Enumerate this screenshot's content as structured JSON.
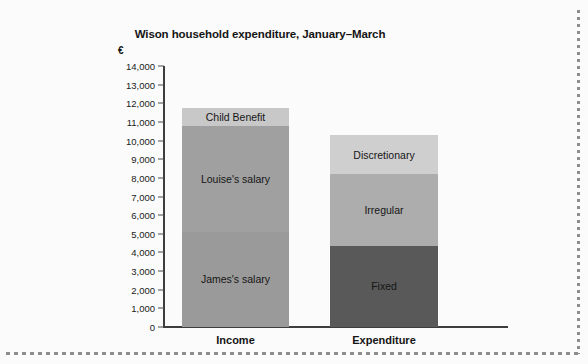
{
  "figure": {
    "background_color": "#fbfbfb",
    "border_style": "dashed-gray-edge"
  },
  "chart_data": {
    "type": "bar",
    "subtype": "stacked",
    "title": "Wison household expenditure, January–March",
    "xlabel": "",
    "ylabel": "",
    "y_unit_symbol": "€",
    "categories": [
      "Income",
      "Expenditure"
    ],
    "ylim": [
      0,
      14000
    ],
    "y_tick_step": 1000,
    "y_ticks": [
      0,
      1000,
      2000,
      3000,
      4000,
      5000,
      6000,
      7000,
      8000,
      9000,
      10000,
      11000,
      12000,
      13000,
      14000
    ],
    "y_tick_labels": [
      "0",
      "1,000",
      "2,000",
      "3,000",
      "4,000",
      "5,000",
      "6,000",
      "7,000",
      "8,000",
      "9,000",
      "10,000",
      "11,000",
      "12,000",
      "13,000",
      "14,000"
    ],
    "grid": false,
    "legend": "inline-segment-labels",
    "stacks": [
      {
        "category": "Income",
        "total": 11750,
        "segments": [
          {
            "name": "James's salary",
            "value": 5100,
            "start": 0,
            "end": 5100,
            "color": "#9a9a9a"
          },
          {
            "name": "Louise's salary",
            "value": 5700,
            "start": 5100,
            "end": 10800,
            "color": "#a0a0a0"
          },
          {
            "name": "Child Benefit",
            "value": 950,
            "start": 10800,
            "end": 11750,
            "color": "#c8c8c8"
          }
        ]
      },
      {
        "category": "Expenditure",
        "total": 10300,
        "segments": [
          {
            "name": "Fixed",
            "value": 4350,
            "start": 0,
            "end": 4350,
            "color": "#595959"
          },
          {
            "name": "Irregular",
            "value": 3850,
            "start": 4350,
            "end": 8200,
            "color": "#adadad"
          },
          {
            "name": "Discretionary",
            "value": 2100,
            "start": 8200,
            "end": 10300,
            "color": "#cfcfcf"
          }
        ]
      }
    ]
  }
}
